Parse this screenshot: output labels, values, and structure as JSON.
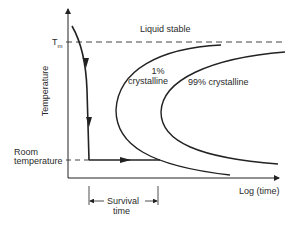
{
  "diagram": {
    "type": "TTT diagram (time-temperature-transformation)",
    "y_axis_label": "Temperature",
    "x_axis_label": "Log (time)",
    "tm_label": "T",
    "tm_subscript": "m",
    "room_temp_label_line1": "Room",
    "room_temp_label_line2": "temperature",
    "region_label": "Liquid stable",
    "curve_1_label_line1": "1%",
    "curve_1_label_line2": "crystalline",
    "curve_99_label": "99% crystalline",
    "survival_label_line1": "Survival",
    "survival_label_line2": "time",
    "colors": {
      "line": "#222222",
      "background": "#ffffff"
    }
  }
}
